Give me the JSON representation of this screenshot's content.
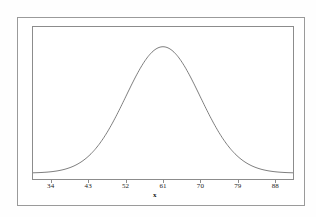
{
  "figure": {
    "background_color": "#fefefe",
    "outer_frame_color": "#9a9a9a",
    "plot_frame_color": "#8c8c8c",
    "curve_color": "#6f6f6f"
  },
  "chart_data": {
    "type": "line",
    "title": "",
    "subtitle": "",
    "xlabel": "x",
    "ylabel": "",
    "grid": false,
    "legend": null,
    "distribution": "normal",
    "mean": 61,
    "std_dev": 9,
    "xlim": [
      29.5,
      92.5
    ],
    "ylim": [
      0,
      1.08
    ],
    "x_tick_labels": [
      "34",
      "43",
      "52",
      "61",
      "70",
      "79",
      "88"
    ],
    "x_ticks": [
      34,
      43,
      52,
      61,
      70,
      79,
      88
    ],
    "y_tick_labels": [],
    "y_ticks": [],
    "x": [
      32,
      34,
      36,
      38,
      40,
      43,
      46,
      49,
      52,
      55,
      58,
      61,
      64,
      67,
      70,
      73,
      76,
      79,
      82,
      85,
      88,
      90
    ],
    "values": [
      0.007,
      0.016,
      0.031,
      0.057,
      0.097,
      0.189,
      0.318,
      0.472,
      0.632,
      0.778,
      0.895,
      1.0,
      0.945,
      0.867,
      0.632,
      0.472,
      0.318,
      0.189,
      0.097,
      0.043,
      0.016,
      0.008
    ],
    "series": [
      {
        "name": "normal-density",
        "values": [
          0.007,
          0.016,
          0.031,
          0.057,
          0.097,
          0.189,
          0.318,
          0.472,
          0.632,
          0.778,
          0.895,
          1.0,
          0.945,
          0.867,
          0.632,
          0.472,
          0.318,
          0.189,
          0.097,
          0.043,
          0.016,
          0.008
        ]
      }
    ]
  }
}
